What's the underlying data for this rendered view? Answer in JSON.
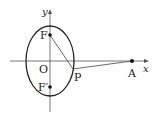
{
  "figure": {
    "type": "ellipse-with-foci",
    "axes": {
      "x_label": "x",
      "y_label": "y",
      "origin_label": "O"
    },
    "ellipse": {
      "center": [
        50,
        61
      ],
      "rx": 24,
      "ry": 35
    },
    "points": [
      {
        "id": "F",
        "label": "F",
        "pos": [
          50,
          35
        ],
        "dot": true
      },
      {
        "id": "F_prime",
        "label": "F′",
        "pos": [
          50,
          87
        ],
        "dot": true
      },
      {
        "id": "P",
        "label": "P",
        "pos": [
          73,
          69
        ],
        "dot": false
      },
      {
        "id": "A",
        "label": "A",
        "pos": [
          132,
          61
        ],
        "dot": true
      }
    ],
    "segments": [
      {
        "from": "F",
        "to": "P"
      },
      {
        "from": "P",
        "to": "A"
      }
    ],
    "colors": {
      "stroke": "#222222",
      "axis": "#555555",
      "background": "#ffffff"
    }
  }
}
